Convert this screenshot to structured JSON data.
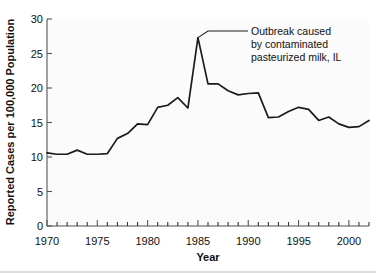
{
  "chart_data": {
    "type": "line",
    "title": "",
    "xlabel": "Year",
    "ylabel": "Reported Cases per 100,000 Population",
    "xlim": [
      1970,
      2002
    ],
    "ylim": [
      0,
      30
    ],
    "yticks": [
      0,
      5,
      10,
      15,
      20,
      25,
      30
    ],
    "ytick_labels": [
      "0",
      "5",
      "10",
      "15",
      "20",
      "25",
      "30"
    ],
    "xticks_labeled": [
      1970,
      1975,
      1980,
      1985,
      1990,
      1995,
      2000
    ],
    "xtick_labels": [
      "1970",
      "1975",
      "1980",
      "1985",
      "1990",
      "1995",
      "2000"
    ],
    "xtick_minor_interval": 1,
    "grid": false,
    "legend": null,
    "series": [
      {
        "name": "Reported Cases per 100,000 Population",
        "x": [
          1970,
          1971,
          1972,
          1973,
          1974,
          1975,
          1976,
          1977,
          1978,
          1979,
          1980,
          1981,
          1982,
          1983,
          1984,
          1985,
          1986,
          1987,
          1988,
          1989,
          1990,
          1991,
          1992,
          1993,
          1994,
          1995,
          1996,
          1997,
          1998,
          1999,
          2000,
          2001,
          2002
        ],
        "values": [
          10.6,
          10.4,
          10.4,
          11.0,
          10.4,
          10.4,
          10.5,
          12.7,
          13.4,
          14.8,
          14.7,
          17.2,
          17.5,
          18.6,
          17.1,
          27.3,
          20.6,
          20.6,
          19.6,
          19.0,
          19.2,
          19.3,
          15.7,
          15.8,
          16.6,
          17.2,
          16.9,
          15.3,
          15.8,
          14.8,
          14.3,
          14.4,
          15.3
        ]
      }
    ],
    "annotations": [
      {
        "text_lines": [
          "Outbreak caused",
          "by contaminated",
          "pasteurized milk, IL"
        ],
        "points_to_x": 1985,
        "points_to_y": 27.3
      }
    ]
  },
  "axis": {
    "y_title": "Reported Cases per 100,000 Population",
    "x_title": "Year"
  },
  "annotation": {
    "line1": "Outbreak caused",
    "line2": "by contaminated",
    "line3": "pasteurized milk, IL"
  },
  "colors": {
    "line": "#1b1b1b",
    "axis": "#8a8a8a",
    "text": "#111111",
    "background": "#ffffff",
    "plot_background": "#fbfbfb"
  }
}
